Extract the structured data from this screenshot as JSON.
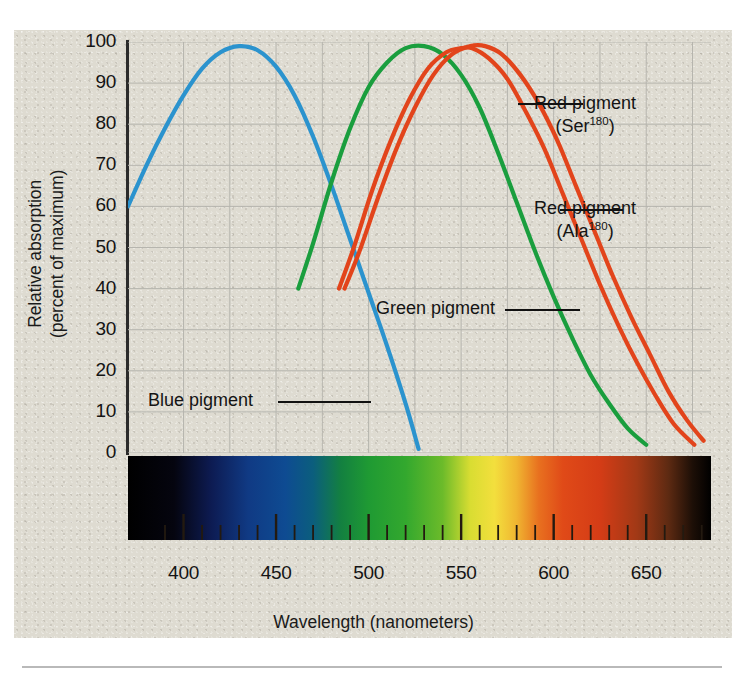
{
  "figure": {
    "background_color": "#dedbd1",
    "panel": {
      "x": 14,
      "y": 30,
      "width": 718,
      "height": 608
    }
  },
  "chart_data": {
    "type": "line",
    "title": "",
    "xlabel": "Wavelength (nanometers)",
    "ylabel": "Relative absorption (percent of maximum)",
    "xlim": [
      370,
      685
    ],
    "ylim": [
      0,
      100
    ],
    "grid": true,
    "legend_position": "inline-annotations",
    "xticks": [
      400,
      450,
      500,
      550,
      600,
      650
    ],
    "yticks": [
      0,
      10,
      20,
      30,
      40,
      50,
      60,
      70,
      80,
      90,
      100
    ],
    "minor_tick_interval_nm": 10,
    "series": [
      {
        "name": "Blue pigment",
        "color": "#2b93ce",
        "peak_nm": 430,
        "peak_value": 99,
        "x": [
          370,
          380,
          390,
          400,
          410,
          420,
          430,
          440,
          450,
          460,
          470,
          480,
          490,
          500,
          510,
          520,
          527
        ],
        "values": [
          60,
          70,
          79,
          87,
          93.5,
          97.5,
          99,
          98,
          94,
          87,
          77,
          65,
          52,
          39,
          26,
          12,
          1
        ]
      },
      {
        "name": "Green pigment",
        "color": "#1a9e3e",
        "peak_nm": 530,
        "peak_value": 99,
        "x": [
          462,
          470,
          480,
          490,
          500,
          510,
          520,
          530,
          540,
          550,
          560,
          570,
          580,
          590,
          600,
          610,
          620,
          630,
          640,
          650
        ],
        "values": [
          40,
          51,
          66,
          79,
          89,
          95,
          98.5,
          99,
          97,
          92,
          84,
          73,
          61,
          49,
          38,
          28,
          19,
          12,
          6,
          2
        ]
      },
      {
        "name": "Red pigment (Ser180)",
        "label_line1": "Red pigment",
        "label_line2": "(Ser",
        "superscript": "180",
        "color": "#e2441b",
        "peak_nm": 563,
        "peak_value": 99,
        "x": [
          487,
          495,
          505,
          515,
          525,
          535,
          545,
          555,
          563,
          572,
          582,
          592,
          602,
          612,
          622,
          632,
          642,
          652,
          662,
          672,
          681
        ],
        "values": [
          40,
          49,
          62,
          74,
          84,
          92,
          97,
          99,
          99,
          97,
          92,
          85,
          76,
          65,
          54,
          43,
          33,
          24,
          15,
          8,
          3
        ]
      },
      {
        "name": "Red pigment (Ala180)",
        "label_line1": "Red pigment",
        "label_line2": "(Ala",
        "superscript": "180",
        "color": "#e2441b",
        "peak_nm": 556,
        "peak_value": 98.5,
        "x": [
          484,
          492,
          502,
          512,
          522,
          532,
          542,
          550,
          556,
          565,
          575,
          585,
          595,
          605,
          615,
          625,
          635,
          645,
          655,
          665,
          676
        ],
        "values": [
          40,
          50,
          64,
          76,
          86,
          93.5,
          97.5,
          98.5,
          98.5,
          96,
          91,
          83,
          74,
          63,
          52,
          41,
          31,
          22,
          14,
          7,
          2
        ]
      }
    ],
    "annotations": [
      {
        "name": "blue-pigment-label",
        "text": "Blue pigment"
      },
      {
        "name": "green-pigment-label",
        "text": "Green pigment"
      },
      {
        "name": "red-pigment-ser-label",
        "text": "Red pigment (Ser180)"
      },
      {
        "name": "red-pigment-ala-label",
        "text": "Red pigment (Ala180)"
      }
    ],
    "spectrum_bar": {
      "description": "visible-light spectrum strip from 370 to 685 nm",
      "stops": [
        {
          "nm": 370,
          "color": "#000000"
        },
        {
          "nm": 395,
          "color": "#05050f"
        },
        {
          "nm": 415,
          "color": "#0d1b52"
        },
        {
          "nm": 435,
          "color": "#103a84"
        },
        {
          "nm": 455,
          "color": "#0e4b92"
        },
        {
          "nm": 470,
          "color": "#0b5e7d"
        },
        {
          "nm": 485,
          "color": "#138040"
        },
        {
          "nm": 500,
          "color": "#1f9a33"
        },
        {
          "nm": 520,
          "color": "#33a82e"
        },
        {
          "nm": 540,
          "color": "#6cbb2a"
        },
        {
          "nm": 555,
          "color": "#d9dd32"
        },
        {
          "nm": 568,
          "color": "#f3df3d"
        },
        {
          "nm": 580,
          "color": "#f0b531"
        },
        {
          "nm": 592,
          "color": "#e8701f"
        },
        {
          "nm": 605,
          "color": "#e04a18"
        },
        {
          "nm": 625,
          "color": "#d43c16"
        },
        {
          "nm": 645,
          "color": "#a13916"
        },
        {
          "nm": 662,
          "color": "#5d2a12"
        },
        {
          "nm": 675,
          "color": "#1d0f07"
        },
        {
          "nm": 685,
          "color": "#000000"
        }
      ]
    }
  }
}
